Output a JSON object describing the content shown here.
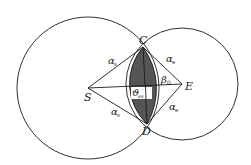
{
  "diagram": {
    "type": "two intersecting circles with lens region",
    "colors": {
      "background": "#ffffff",
      "stroke": "#1a1a1a",
      "lens_fill": "#555555",
      "label_box": "#ffffff"
    },
    "circles": [
      {
        "name": "large-circle",
        "center_point": "S"
      },
      {
        "name": "small-circle",
        "center_point": "E"
      }
    ],
    "points": {
      "S": "S",
      "E": "E",
      "C": "C",
      "D": "D"
    },
    "labels": {
      "alpha_s_top": {
        "base": "α",
        "sub": "s"
      },
      "alpha_s_bottom": {
        "base": "α",
        "sub": "s"
      },
      "alpha_e_top": {
        "base": "α",
        "sub": "e"
      },
      "alpha_e_bottom": {
        "base": "α",
        "sub": "e"
      },
      "beta_0": {
        "base": "β",
        "sub": "0"
      },
      "theta_es": {
        "base": "ϑ",
        "sub": "es"
      }
    }
  }
}
